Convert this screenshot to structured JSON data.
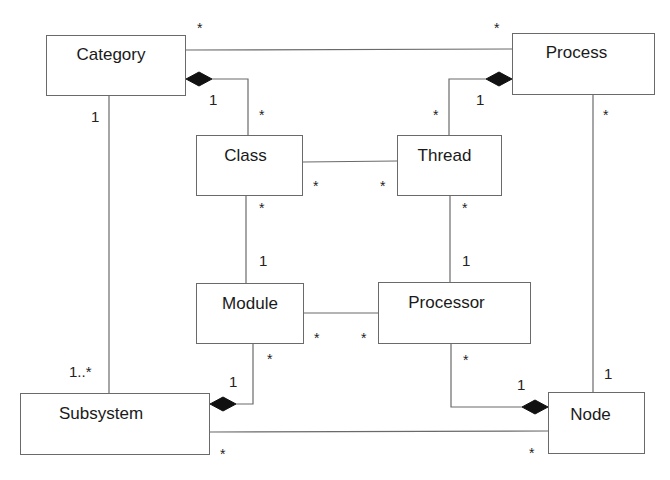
{
  "diagram": {
    "type": "UML class diagram",
    "classes": [
      {
        "id": "category",
        "label": "Category",
        "x": 46,
        "y": 35,
        "w": 140,
        "h": 61,
        "labelLeft": -10,
        "labelTop": 9
      },
      {
        "id": "class",
        "label": "Class",
        "x": 196,
        "y": 135,
        "w": 107,
        "h": 61,
        "labelLeft": -8,
        "labelTop": 10
      },
      {
        "id": "process",
        "label": "Process",
        "x": 512,
        "y": 33,
        "w": 143,
        "h": 62,
        "labelLeft": -14,
        "labelTop": 9
      },
      {
        "id": "thread",
        "label": "Thread",
        "x": 397,
        "y": 135,
        "w": 105,
        "h": 61,
        "labelLeft": -10,
        "labelTop": 10
      },
      {
        "id": "module",
        "label": "Module",
        "x": 196,
        "y": 283,
        "w": 108,
        "h": 61,
        "labelLeft": 0,
        "labelTop": 10
      },
      {
        "id": "processor",
        "label": "Processor",
        "x": 378,
        "y": 282,
        "w": 153,
        "h": 62,
        "labelLeft": -16,
        "labelTop": 10
      },
      {
        "id": "subsystem",
        "label": "Subsystem",
        "x": 20,
        "y": 393,
        "w": 190,
        "h": 62,
        "labelLeft": -28,
        "labelTop": 10
      },
      {
        "id": "node",
        "label": "Node",
        "x": 548,
        "y": 392,
        "w": 97,
        "h": 62,
        "labelLeft": -12,
        "labelTop": 12
      }
    ],
    "associations": [
      {
        "from": "category",
        "to": "process",
        "kind": "association",
        "fromMult": "*",
        "toMult": "*"
      },
      {
        "from": "category",
        "to": "class",
        "kind": "composition",
        "fromMult": "1",
        "toMult": "*"
      },
      {
        "from": "process",
        "to": "thread",
        "kind": "composition",
        "fromMult": "1",
        "toMult": "*"
      },
      {
        "from": "class",
        "to": "thread",
        "kind": "association",
        "fromMult": "*",
        "toMult": "*"
      },
      {
        "from": "class",
        "to": "module",
        "kind": "association",
        "fromMult": "*",
        "toMult": "1"
      },
      {
        "from": "thread",
        "to": "processor",
        "kind": "association",
        "fromMult": "*",
        "toMult": "1"
      },
      {
        "from": "module",
        "to": "processor",
        "kind": "association",
        "fromMult": "*",
        "toMult": "*"
      },
      {
        "from": "category",
        "to": "subsystem",
        "kind": "association",
        "fromMult": "1",
        "toMult": "1..*"
      },
      {
        "from": "process",
        "to": "node",
        "kind": "association",
        "fromMult": "*",
        "toMult": "1"
      },
      {
        "from": "subsystem",
        "to": "module",
        "kind": "composition",
        "fromMult": "1",
        "toMult": "*"
      },
      {
        "from": "node",
        "to": "processor",
        "kind": "composition",
        "fromMult": "1",
        "toMult": "*"
      },
      {
        "from": "subsystem",
        "to": "node",
        "kind": "association",
        "fromMult": "*",
        "toMult": "*"
      }
    ],
    "multiplicities": [
      {
        "text": "*",
        "x": 197,
        "y": 21
      },
      {
        "text": "*",
        "x": 494,
        "y": 21
      },
      {
        "text": "1",
        "x": 209,
        "y": 92
      },
      {
        "text": "*",
        "x": 259,
        "y": 108
      },
      {
        "text": "1",
        "x": 476,
        "y": 92
      },
      {
        "text": "*",
        "x": 433,
        "y": 108
      },
      {
        "text": "*",
        "x": 603,
        "y": 108
      },
      {
        "text": "1",
        "x": 91,
        "y": 109
      },
      {
        "text": "*",
        "x": 313,
        "y": 179
      },
      {
        "text": "*",
        "x": 380,
        "y": 179
      },
      {
        "text": "*",
        "x": 259,
        "y": 201
      },
      {
        "text": "*",
        "x": 462,
        "y": 201
      },
      {
        "text": "1",
        "x": 259,
        "y": 253
      },
      {
        "text": "1",
        "x": 462,
        "y": 253
      },
      {
        "text": "*",
        "x": 314,
        "y": 331
      },
      {
        "text": "*",
        "x": 361,
        "y": 331
      },
      {
        "text": "*",
        "x": 267,
        "y": 352
      },
      {
        "text": "*",
        "x": 463,
        "y": 353
      },
      {
        "text": "1",
        "x": 604,
        "y": 366
      },
      {
        "text": "1..*",
        "x": 69,
        "y": 364
      },
      {
        "text": "1",
        "x": 229,
        "y": 374
      },
      {
        "text": "1",
        "x": 517,
        "y": 377
      },
      {
        "text": "*",
        "x": 220,
        "y": 447
      },
      {
        "text": "*",
        "x": 529,
        "y": 446
      }
    ]
  },
  "colors": {
    "line": "#6a6a6a",
    "diamond": "#111111",
    "text": "#1a1a1a",
    "background": "#ffffff"
  }
}
